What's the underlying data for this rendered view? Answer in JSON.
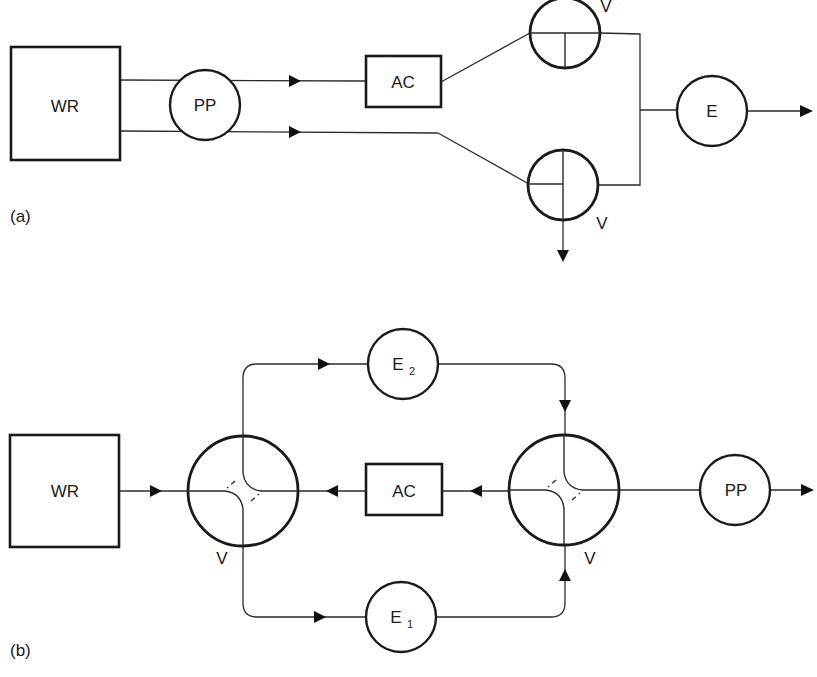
{
  "figure": {
    "panels": [
      {
        "id": "a",
        "label": "(a)",
        "nodes": {
          "water_reservoir": "WR",
          "pump": "PP",
          "auxiliary_column": "AC",
          "valve_top": "V",
          "valve_bottom": "V",
          "exchanger": "E"
        }
      },
      {
        "id": "b",
        "label": "(b)",
        "nodes": {
          "water_reservoir": "WR",
          "valve_left": "V",
          "auxiliary_column": "AC",
          "valve_right": "V",
          "exchanger_2": "E",
          "exchanger_2_sub": "2",
          "exchanger_1": "E",
          "exchanger_1_sub": "1",
          "pump": "PP"
        }
      }
    ],
    "colors": {
      "stroke": "#1a1a1a",
      "background": "#ffffff"
    }
  }
}
